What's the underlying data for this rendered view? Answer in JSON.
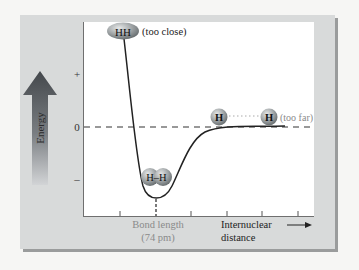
{
  "diagram": {
    "type": "potential-energy-curve",
    "y_axis": {
      "label": "Energy",
      "ticks": [
        "+",
        "0",
        "–"
      ]
    },
    "x_axis": {
      "label_line1": "Internuclear",
      "label_line2": "distance",
      "tick_count": 6
    },
    "annotations": {
      "too_close": {
        "molecule": "HH",
        "text": "(too close)"
      },
      "bond": {
        "molecule": "H–H",
        "label_line1": "Bond length",
        "label_line2": "(74 pm)"
      },
      "too_far": {
        "atom_left": "H",
        "atom_right": "H",
        "text": "(too far)"
      }
    },
    "colors": {
      "frame": "#d8dada",
      "frame_shadow": "#9a9c9c",
      "plot_bg": "#ffffff",
      "curve": "#222222",
      "arrow_top": "#4a4e52",
      "arrow_bottom": "#c8cacc",
      "atom": "#8f9496",
      "muted_text": "#8a8a8a"
    }
  }
}
